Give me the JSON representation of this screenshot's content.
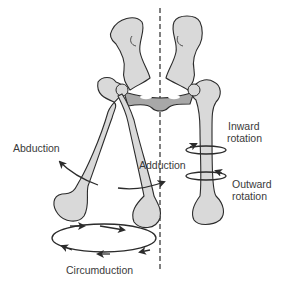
{
  "diagram": {
    "labels": {
      "abduction": "Abduction",
      "adduction": "Adduction",
      "inward_rotation_line1": "Inward",
      "inward_rotation_line2": "rotation",
      "outward_rotation_line1": "Outward",
      "outward_rotation_line2": "rotation",
      "circumduction": "Circumduction"
    },
    "colors": {
      "bone_fill": "#d9d9d9",
      "pelvis_fill": "#a8a8a8",
      "outline": "#2b2b2b",
      "text": "#3a3a3a",
      "background": "#ffffff"
    }
  }
}
